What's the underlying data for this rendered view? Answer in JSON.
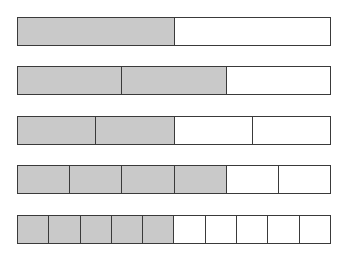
{
  "chart_data": {
    "type": "bar",
    "title": "",
    "subtitle": "",
    "xlabel": "",
    "ylabel": "",
    "legend": [],
    "grid": false,
    "categories": [
      "1/2",
      "2/3",
      "2/4",
      "4/6",
      "5/10"
    ],
    "values": [
      0.5,
      0.6667,
      0.5,
      0.6667,
      0.5
    ],
    "series": [
      {
        "name": "shaded segments",
        "values": [
          1,
          2,
          2,
          4,
          5
        ]
      },
      {
        "name": "total segments",
        "values": [
          2,
          3,
          4,
          6,
          10
        ]
      }
    ],
    "bars": [
      {
        "label": "1/2",
        "numerator": 1,
        "denominator": 2,
        "fraction": 0.5
      },
      {
        "label": "2/3",
        "numerator": 2,
        "denominator": 3,
        "fraction": 0.6667
      },
      {
        "label": "2/4",
        "numerator": 2,
        "denominator": 4,
        "fraction": 0.5
      },
      {
        "label": "4/6",
        "numerator": 4,
        "denominator": 6,
        "fraction": 0.6667
      },
      {
        "label": "5/10",
        "numerator": 5,
        "denominator": 10,
        "fraction": 0.5
      }
    ],
    "colors": {
      "shaded_fill": "#c9c9c9",
      "unshaded_fill": "#ffffff",
      "border": "#3a3a3a",
      "background": "#ffffff"
    },
    "layout": {
      "bar_left": 17,
      "bar_width": 314,
      "bar_height": 29,
      "bar_tops": [
        17,
        66,
        116,
        165,
        215
      ]
    }
  }
}
